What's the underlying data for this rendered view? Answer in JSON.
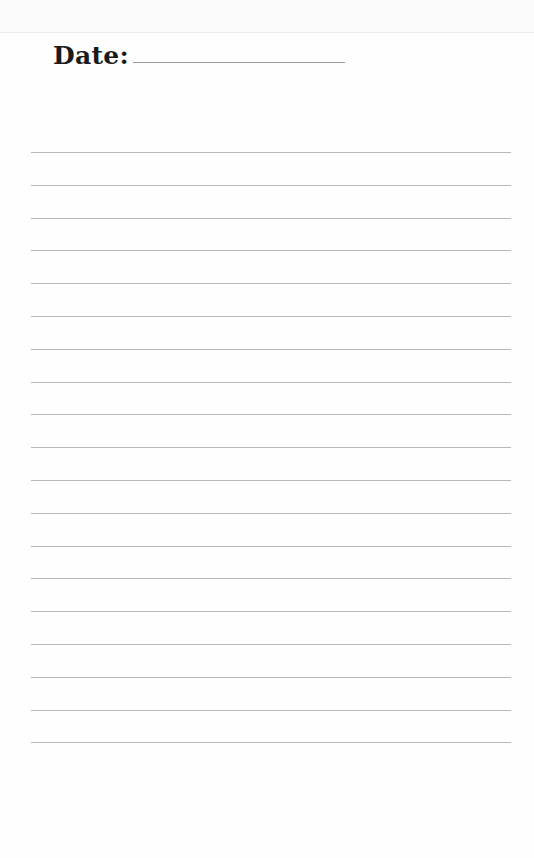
{
  "page": {
    "header": {
      "date_label": "Date:",
      "date_value": ""
    },
    "ruled_lines": {
      "count": 19,
      "first_y": 152,
      "spacing": 32.8,
      "color": "#b8b8b8"
    }
  }
}
